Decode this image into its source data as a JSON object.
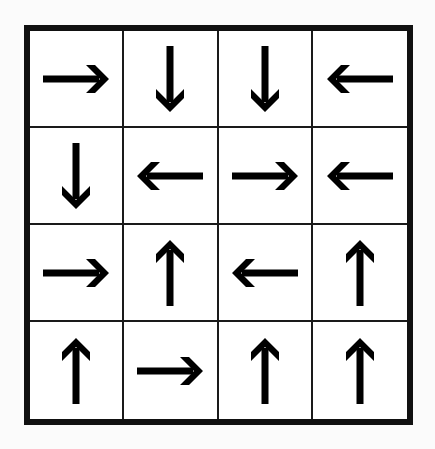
{
  "puzzle": {
    "rows": 4,
    "cols": 4,
    "colors": {
      "line": "#111111",
      "arrow": "#000000",
      "background": "#ffffff"
    },
    "cells": [
      [
        "right",
        "down",
        "down",
        "left"
      ],
      [
        "down",
        "left",
        "right",
        "left"
      ],
      [
        "right",
        "up",
        "left",
        "up"
      ],
      [
        "up",
        "right",
        "up",
        "up"
      ]
    ]
  }
}
